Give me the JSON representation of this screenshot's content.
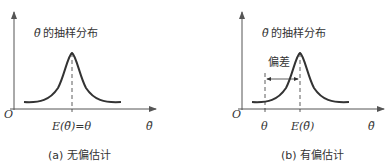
{
  "panels": [
    {
      "id": "a",
      "dist_label_symbol": "θ̃",
      "dist_label_text": "的抽样分布",
      "origin": "O",
      "x_axis_label": "θ̃",
      "tick_label": "E(θ̃)=θ",
      "caption": "(a) 无偏估计"
    },
    {
      "id": "b",
      "dist_label_symbol": "θ̃",
      "dist_label_text": "的抽样分布",
      "origin": "O",
      "x_axis_label": "θ̃",
      "tick_label_theta": "θ",
      "tick_label_mean": "E(θ̃)",
      "bias_label": "偏差",
      "caption": "(b) 有偏估计"
    }
  ],
  "colors": {
    "stroke": "#333333",
    "axis": "#555555"
  }
}
